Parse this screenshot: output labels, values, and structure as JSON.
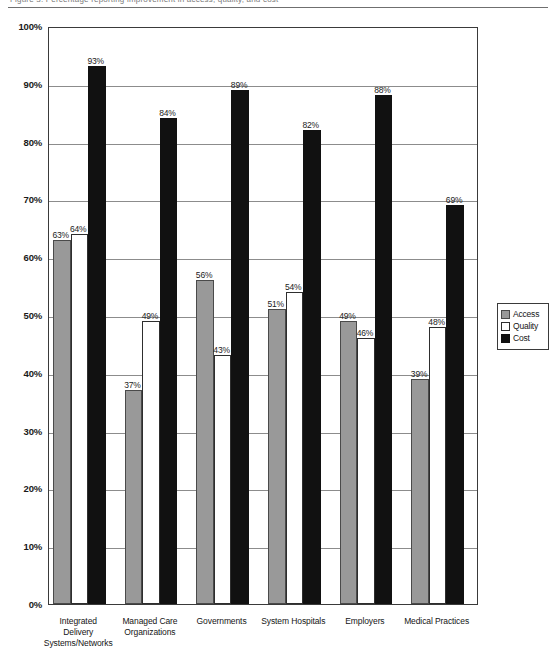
{
  "top_strip": {
    "clipped_text": "Figure 3.  Percentage reporting improvement in access, quality, and cost"
  },
  "chart_data": {
    "type": "bar",
    "title": "",
    "xlabel": "",
    "ylabel": "",
    "ylim": [
      0,
      100
    ],
    "grid": true,
    "legend_position": "right",
    "y_ticks": [
      "0%",
      "10%",
      "20%",
      "30%",
      "40%",
      "50%",
      "60%",
      "70%",
      "80%",
      "90%",
      "100%"
    ],
    "y_tick_values": [
      0,
      10,
      20,
      30,
      40,
      50,
      60,
      70,
      80,
      90,
      100
    ],
    "categories": [
      "Integrated Delivery Systems/Networks",
      "Managed Care Organizations",
      "Governments",
      "System Hospitals",
      "Employers",
      "Medical Practices"
    ],
    "category_lines": [
      [
        "Integrated",
        "Delivery",
        "Systems/Networks"
      ],
      [
        "Managed Care",
        "Organizations"
      ],
      [
        "Governments"
      ],
      [
        "System Hospitals"
      ],
      [
        "Employers"
      ],
      [
        "Medical Practices"
      ]
    ],
    "series": [
      {
        "name": "Access",
        "color": "#999999",
        "values": [
          63,
          37,
          56,
          51,
          49,
          39
        ],
        "labels": [
          "63%",
          "37%",
          "56%",
          "51%",
          "49%",
          "39%"
        ]
      },
      {
        "name": "Quality",
        "color": "#ffffff",
        "values": [
          64,
          49,
          43,
          54,
          46,
          48
        ],
        "labels": [
          "64%",
          "49%",
          "43%",
          "54%",
          "46%",
          "48%"
        ]
      },
      {
        "name": "Cost",
        "color": "#111111",
        "values": [
          93,
          84,
          89,
          82,
          88,
          69
        ],
        "labels": [
          "93%",
          "84%",
          "89%",
          "82%",
          "88%",
          "69%"
        ]
      }
    ],
    "legend": [
      "Access",
      "Quality",
      "Cost"
    ]
  }
}
